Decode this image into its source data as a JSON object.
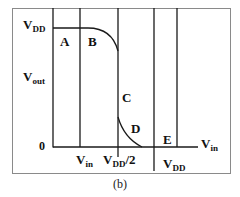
{
  "figure": {
    "caption": "(b)",
    "stroke_color": "#1a1a1a",
    "frame_color": "#8a8a8a"
  },
  "axes": {
    "y_axis": {
      "label_main": "V",
      "label_sub": "out",
      "top_tick_main": "V",
      "top_tick_sub": "DD",
      "origin": "0"
    },
    "x_axis": {
      "label_main": "V",
      "label_sub": "in"
    },
    "x_ticks": [
      {
        "main": "V",
        "sub": "in",
        "suffix": ""
      },
      {
        "main": "V",
        "sub": "DD",
        "suffix": "/2"
      },
      {
        "main": "V",
        "sub": "DD",
        "suffix": ""
      }
    ]
  },
  "regions": [
    {
      "label": "A"
    },
    {
      "label": "B"
    },
    {
      "label": "C"
    },
    {
      "label": "D"
    },
    {
      "label": "E"
    }
  ]
}
